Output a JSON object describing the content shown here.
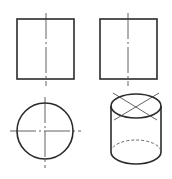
{
  "figure": {
    "colors": {
      "line": "#2b2b2b",
      "background": "#ffffff"
    },
    "views": [
      {
        "name": "front-view",
        "shape": "rectangle",
        "x": 17,
        "y": 19,
        "w": 57,
        "h": 60,
        "centerline_x": 46
      },
      {
        "name": "side-view",
        "shape": "rectangle",
        "x": 100,
        "y": 19,
        "w": 57,
        "h": 60,
        "centerline_x": 128
      },
      {
        "name": "top-view",
        "shape": "circle",
        "cx": 45,
        "cy": 131,
        "r": 28
      },
      {
        "name": "isometric-view",
        "shape": "cylinder",
        "cx": 136,
        "top_cy": 106,
        "bottom_cy": 152,
        "rx": 25,
        "ry": 12
      }
    ]
  }
}
